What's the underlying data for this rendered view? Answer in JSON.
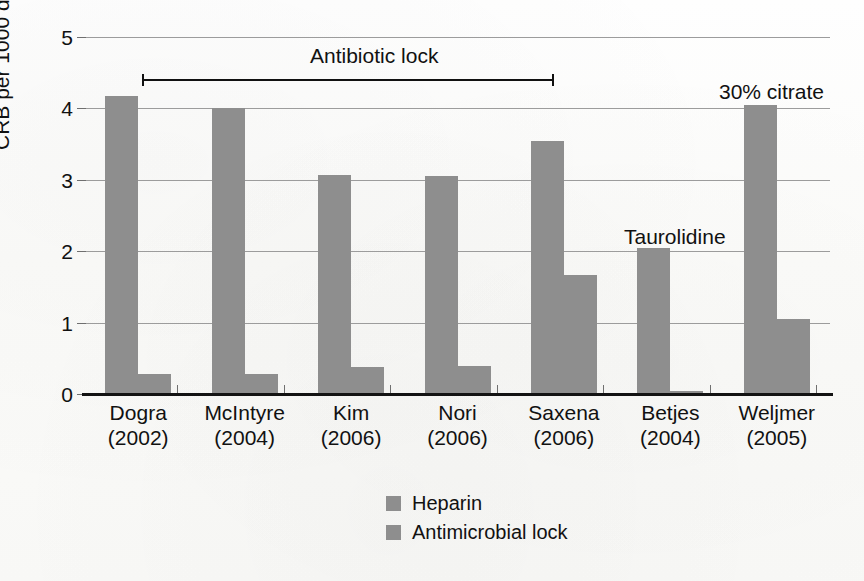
{
  "chart_data": {
    "type": "bar",
    "title": "",
    "xlabel": "",
    "ylabel": "CRB per 1000 days",
    "ylim": [
      0,
      5
    ],
    "yticks": [
      0,
      1,
      2,
      3,
      4,
      5
    ],
    "ytick_labels": [
      "0",
      "1",
      "2",
      "3",
      "4",
      "5"
    ],
    "grid": true,
    "legend_position": "bottom-center",
    "categories": [
      "Dogra\n(2002)",
      "McIntyre\n(2004)",
      "Kim\n(2006)",
      "Nori\n(2006)",
      "Saxena\n(2006)",
      "Betjes\n(2004)",
      "Weljmer\n(2005)"
    ],
    "category_names": [
      "Dogra",
      "McIntyre",
      "Kim",
      "Nori",
      "Saxena",
      "Betjes",
      "Weljmer"
    ],
    "category_years": [
      "(2002)",
      "(2004)",
      "(2006)",
      "(2006)",
      "(2006)",
      "(2004)",
      "(2005)"
    ],
    "series": [
      {
        "name": "Heparin",
        "color": "#8e8e8e",
        "values": [
          4.17,
          4.0,
          3.07,
          3.06,
          3.55,
          2.05,
          4.05
        ]
      },
      {
        "name": "Antimicrobial lock",
        "color": "#8e8e8e",
        "values": [
          0.28,
          0.28,
          0.38,
          0.39,
          1.66,
          0.04,
          1.05
        ]
      }
    ],
    "annotations": [
      {
        "id": "antibiotic-lock",
        "text": "Antibiotic lock",
        "type": "span-arrow",
        "spans_categories": [
          "Dogra",
          "Saxena"
        ]
      },
      {
        "id": "taurolidine",
        "text": "Taurolidine",
        "type": "point-label",
        "category": "Betjes"
      },
      {
        "id": "citrate",
        "text": "30% citrate",
        "type": "point-label",
        "category": "Weljmer"
      }
    ]
  },
  "legend": {
    "items": [
      {
        "label": "Heparin",
        "color": "#8e8e8e"
      },
      {
        "label": "Antimicrobial lock",
        "color": "#8e8e8e"
      }
    ]
  },
  "axis": {
    "y_title": "CRB per 1000 days",
    "ticks": [
      "5",
      "4",
      "3",
      "2",
      "1",
      "0"
    ]
  },
  "annotations": {
    "antibiotic_lock": "Antibiotic lock",
    "taurolidine": "Taurolidine",
    "citrate": "30% citrate"
  }
}
